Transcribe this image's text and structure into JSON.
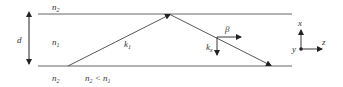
{
  "diagram": {
    "labels": {
      "top_cladding": "n",
      "top_cladding_sub": "2",
      "core": "n",
      "core_sub": "1",
      "bottom_cladding": "n",
      "bottom_cladding_sub": "2",
      "condition_a": "n",
      "condition_a_sub": "2",
      "condition_op": " < ",
      "condition_b": "n",
      "condition_b_sub": "1",
      "thickness": "d",
      "wavevector": "k",
      "wavevector_sub": "1",
      "propagation_constant": "β",
      "transverse_k": "k",
      "transverse_k_sub": "x",
      "axis_x": "x",
      "axis_y": "y",
      "axis_z": "z"
    },
    "colors": {
      "line": "#444444",
      "boundary": "#555555",
      "text": "#333333"
    }
  }
}
